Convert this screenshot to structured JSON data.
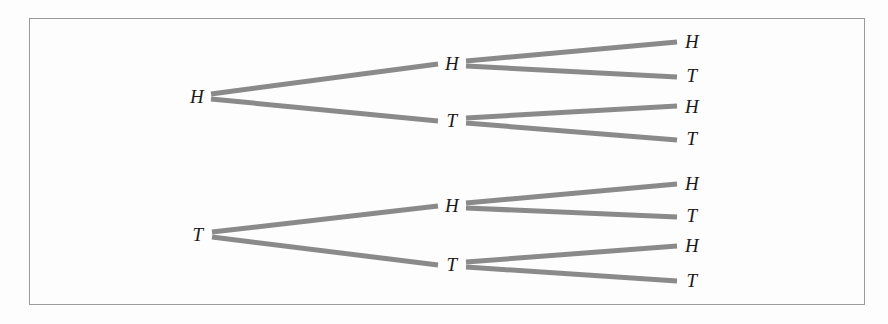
{
  "figure": {
    "kind": "probability-tree-diagram",
    "frame": {
      "border_color": "#9a9a9a",
      "background_color": "#fdfdfd",
      "x": 29,
      "y": 18,
      "width": 836,
      "height": 287
    },
    "branch": {
      "color": "#8a8a8a",
      "width": 5
    },
    "label_color": "#1a1a1a"
  },
  "chart_data": {
    "type": "diagram",
    "title": "",
    "xlabel": "",
    "ylabel": "",
    "levels": 3,
    "level_labels": [
      "Flip 1",
      "Flip 2",
      "Flip 3"
    ],
    "outcomes": [
      "HHH",
      "HHT",
      "HTH",
      "HTT",
      "THH",
      "THT",
      "TTH",
      "TTT"
    ],
    "nodes": [
      {
        "id": "n1",
        "label": "H",
        "level": 1,
        "x": 197,
        "y": 96
      },
      {
        "id": "n2",
        "label": "T",
        "level": 1,
        "x": 198,
        "y": 234
      },
      {
        "id": "n11",
        "label": "H",
        "level": 2,
        "x": 452,
        "y": 63
      },
      {
        "id": "n12",
        "label": "T",
        "level": 2,
        "x": 452,
        "y": 120
      },
      {
        "id": "n21",
        "label": "H",
        "level": 2,
        "x": 452,
        "y": 205
      },
      {
        "id": "n22",
        "label": "T",
        "level": 2,
        "x": 452,
        "y": 264
      },
      {
        "id": "n111",
        "label": "H",
        "level": 3,
        "x": 692,
        "y": 41
      },
      {
        "id": "n112",
        "label": "T",
        "level": 3,
        "x": 692,
        "y": 75
      },
      {
        "id": "n121",
        "label": "H",
        "level": 3,
        "x": 692,
        "y": 106
      },
      {
        "id": "n122",
        "label": "T",
        "level": 3,
        "x": 692,
        "y": 138
      },
      {
        "id": "n211",
        "label": "H",
        "level": 3,
        "x": 692,
        "y": 183
      },
      {
        "id": "n212",
        "label": "T",
        "level": 3,
        "x": 692,
        "y": 215
      },
      {
        "id": "n221",
        "label": "H",
        "level": 3,
        "x": 692,
        "y": 245
      },
      {
        "id": "n222",
        "label": "T",
        "level": 3,
        "x": 692,
        "y": 280
      }
    ],
    "edges": [
      {
        "from": "n1",
        "to": "n11",
        "x1": 211,
        "y1": 94,
        "x2": 438,
        "y2": 64
      },
      {
        "from": "n1",
        "to": "n12",
        "x1": 211,
        "y1": 99,
        "x2": 438,
        "y2": 121
      },
      {
        "from": "n2",
        "to": "n21",
        "x1": 212,
        "y1": 232,
        "x2": 438,
        "y2": 206
      },
      {
        "from": "n2",
        "to": "n22",
        "x1": 212,
        "y1": 237,
        "x2": 438,
        "y2": 265
      },
      {
        "from": "n11",
        "to": "n111",
        "x1": 466,
        "y1": 61,
        "x2": 677,
        "y2": 42
      },
      {
        "from": "n11",
        "to": "n112",
        "x1": 466,
        "y1": 66,
        "x2": 677,
        "y2": 77
      },
      {
        "from": "n12",
        "to": "n121",
        "x1": 466,
        "y1": 118,
        "x2": 677,
        "y2": 106
      },
      {
        "from": "n12",
        "to": "n122",
        "x1": 466,
        "y1": 123,
        "x2": 677,
        "y2": 140
      },
      {
        "from": "n21",
        "to": "n211",
        "x1": 466,
        "y1": 203,
        "x2": 677,
        "y2": 184
      },
      {
        "from": "n21",
        "to": "n212",
        "x1": 466,
        "y1": 208,
        "x2": 677,
        "y2": 217
      },
      {
        "from": "n22",
        "to": "n221",
        "x1": 466,
        "y1": 262,
        "x2": 677,
        "y2": 246
      },
      {
        "from": "n22",
        "to": "n222",
        "x1": 466,
        "y1": 267,
        "x2": 677,
        "y2": 281
      }
    ]
  }
}
